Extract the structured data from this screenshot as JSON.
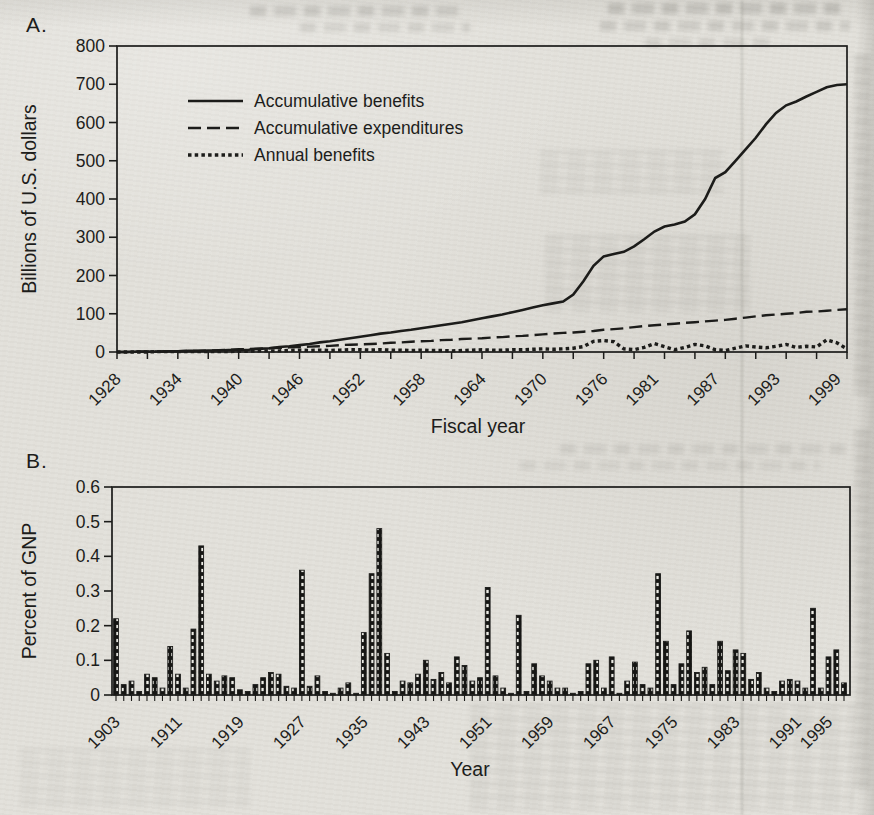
{
  "figure": {
    "panel_a": {
      "label": "A.",
      "y_axis_label": "Billions of U.S. dollars",
      "x_axis_label": "Fiscal year"
    },
    "panel_b": {
      "label": "B.",
      "y_axis_label": "Percent of GNP",
      "x_axis_label": "Year"
    }
  },
  "chart_data": [
    {
      "type": "line",
      "panel": "A",
      "xlabel": "Fiscal year",
      "ylabel": "Billions of U.S. dollars",
      "ylim": [
        0,
        800
      ],
      "y_ticks": [
        0,
        100,
        200,
        300,
        400,
        500,
        600,
        700,
        800
      ],
      "x_start": 1928,
      "x_end": 2000,
      "x_step": 1,
      "x_minor_tick_step": 3,
      "x_tick_labels": [
        "1928",
        "1934",
        "1940",
        "1946",
        "1952",
        "1958",
        "1964",
        "1970",
        "1976",
        "1981",
        "1987",
        "1993",
        "1999"
      ],
      "grid": false,
      "legend_position": "top-left",
      "series": [
        {
          "name": "Accumulative benefits",
          "style": "solid",
          "values": [
            0,
            0,
            1,
            1,
            1,
            2,
            2,
            3,
            3,
            4,
            4,
            5,
            5,
            6,
            8,
            10,
            13,
            15,
            18,
            21,
            25,
            28,
            32,
            36,
            40,
            44,
            48,
            51,
            55,
            58,
            62,
            66,
            70,
            74,
            78,
            83,
            88,
            93,
            98,
            104,
            110,
            116,
            122,
            127,
            132,
            150,
            185,
            225,
            250,
            256,
            262,
            276,
            295,
            315,
            328,
            333,
            341,
            360,
            400,
            455,
            470,
            500,
            530,
            560,
            595,
            625,
            645,
            655,
            668,
            680,
            692,
            698,
            700
          ]
        },
        {
          "name": "Accumulative expenditures",
          "style": "dashed",
          "values": [
            0,
            0,
            1,
            1,
            1,
            2,
            2,
            3,
            3,
            4,
            5,
            6,
            7,
            8,
            9,
            10,
            11,
            12,
            13,
            14,
            15,
            16,
            18,
            19,
            20,
            21,
            22,
            24,
            25,
            27,
            28,
            29,
            31,
            32,
            34,
            35,
            36,
            38,
            39,
            41,
            42,
            44,
            46,
            48,
            50,
            51,
            53,
            55,
            58,
            60,
            62,
            65,
            68,
            70,
            72,
            74,
            76,
            78,
            80,
            82,
            84,
            87,
            90,
            93,
            96,
            98,
            100,
            102,
            105,
            106,
            108,
            110,
            112
          ]
        },
        {
          "name": "Annual benefits",
          "style": "dotted",
          "values": [
            0,
            0,
            0,
            0,
            1,
            1,
            1,
            1,
            1,
            1,
            1,
            1,
            2,
            2,
            3,
            3,
            3,
            4,
            5,
            4,
            5,
            4,
            5,
            6,
            6,
            5,
            6,
            5,
            5,
            4,
            5,
            4,
            4,
            3,
            4,
            5,
            6,
            5,
            5,
            6,
            6,
            7,
            8,
            7,
            8,
            10,
            14,
            28,
            30,
            27,
            8,
            6,
            12,
            22,
            14,
            6,
            12,
            20,
            16,
            6,
            4,
            10,
            16,
            13,
            11,
            15,
            20,
            12,
            15,
            13,
            32,
            24,
            8
          ]
        }
      ]
    },
    {
      "type": "bar",
      "panel": "B",
      "xlabel": "Year",
      "ylabel": "Percent of GNP",
      "ylim": [
        0,
        0.6
      ],
      "y_ticks": [
        0,
        0.1,
        0.2,
        0.3,
        0.4,
        0.5,
        0.6
      ],
      "y_tick_labels": [
        "0",
        "0.1",
        "0.2",
        "0.3",
        "0.4",
        "0.5",
        "0.6"
      ],
      "x_start": 1903,
      "x_end": 1997,
      "x_step": 1,
      "x_tick_labels": [
        "1903",
        "1911",
        "1919",
        "1927",
        "1935",
        "1943",
        "1951",
        "1959",
        "1967",
        "1975",
        "1983",
        "1991",
        "1995"
      ],
      "grid": false,
      "values": [
        0.22,
        0.03,
        0.04,
        0.01,
        0.06,
        0.05,
        0.02,
        0.14,
        0.06,
        0.02,
        0.19,
        0.43,
        0.06,
        0.04,
        0.055,
        0.05,
        0.015,
        0.01,
        0.03,
        0.05,
        0.065,
        0.06,
        0.025,
        0.02,
        0.36,
        0.025,
        0.055,
        0.01,
        0.005,
        0.02,
        0.035,
        0.005,
        0.18,
        0.35,
        0.48,
        0.12,
        0.01,
        0.04,
        0.035,
        0.06,
        0.1,
        0.045,
        0.065,
        0.035,
        0.11,
        0.085,
        0.04,
        0.05,
        0.31,
        0.055,
        0.02,
        0.005,
        0.23,
        0.01,
        0.09,
        0.055,
        0.04,
        0.02,
        0.02,
        0.005,
        0.01,
        0.09,
        0.1,
        0.02,
        0.11,
        0.005,
        0.04,
        0.095,
        0.03,
        0.02,
        0.35,
        0.155,
        0.03,
        0.09,
        0.185,
        0.065,
        0.08,
        0.03,
        0.155,
        0.07,
        0.13,
        0.12,
        0.045,
        0.065,
        0.02,
        0.01,
        0.04,
        0.045,
        0.04,
        0.02,
        0.25,
        0.02,
        0.11,
        0.13,
        0.035
      ]
    }
  ]
}
